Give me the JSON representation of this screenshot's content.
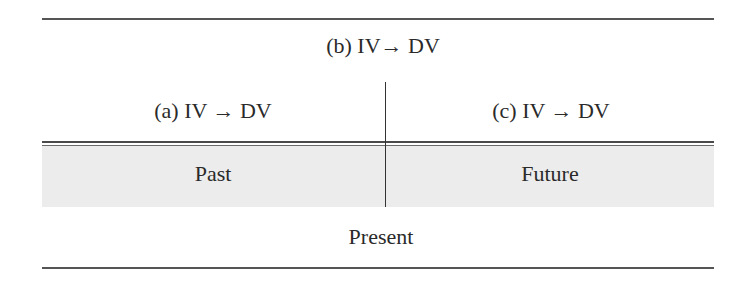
{
  "diagram": {
    "top_label": "(b) IV→ DV",
    "left_label": "(a) IV → DV",
    "right_label": "(c) IV → DV",
    "shaded_row": {
      "left": "Past",
      "right": "Future"
    },
    "bottom_label": "Present"
  },
  "colors": {
    "rule": "#555555",
    "shade": "#ececec",
    "text": "#2a2a2a"
  }
}
